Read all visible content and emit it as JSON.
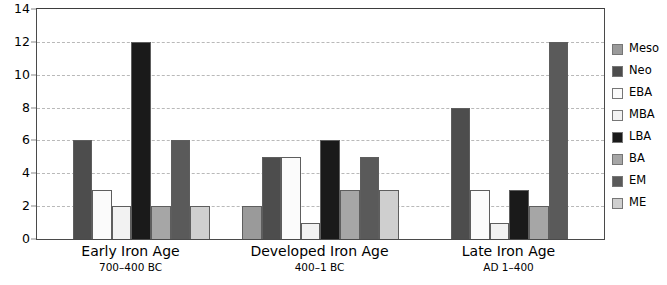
{
  "chart_data": {
    "type": "bar",
    "title": "",
    "xlabel": "",
    "ylabel": "",
    "ylim": [
      0,
      14
    ],
    "ytick_step": 2,
    "yticks": [
      0,
      2,
      4,
      6,
      8,
      10,
      12,
      14
    ],
    "grid": true,
    "legend_position": "right",
    "categories": [
      "Early Iron Age",
      "Developed Iron Age",
      "Late Iron Age"
    ],
    "category_subtitles": [
      "700–400 BC",
      "400–1 BC",
      "AD 1–400"
    ],
    "series": [
      {
        "name": "Meso",
        "color": "#9a9a9a",
        "values": [
          null,
          2,
          null
        ]
      },
      {
        "name": "Neo",
        "color": "#4d4d4d",
        "values": [
          6,
          5,
          8
        ]
      },
      {
        "name": "EBA",
        "color": "#fbfbfb",
        "values": [
          3,
          5,
          3
        ]
      },
      {
        "name": "MBA",
        "color": "#f2f2f2",
        "values": [
          2,
          1,
          1
        ]
      },
      {
        "name": "LBA",
        "color": "#1a1a1a",
        "values": [
          12,
          6,
          3
        ]
      },
      {
        "name": "BA",
        "color": "#a6a6a6",
        "values": [
          2,
          3,
          2
        ]
      },
      {
        "name": "EM",
        "color": "#5a5a5a",
        "values": [
          6,
          5,
          12
        ]
      },
      {
        "name": "ME",
        "color": "#cfcfcf",
        "values": [
          2,
          3,
          null
        ]
      }
    ]
  },
  "legend": {
    "items": [
      {
        "label": "Meso"
      },
      {
        "label": "Neo"
      },
      {
        "label": "EBA"
      },
      {
        "label": "MBA"
      },
      {
        "label": "LBA"
      },
      {
        "label": "BA"
      },
      {
        "label": "EM"
      },
      {
        "label": "ME"
      }
    ]
  }
}
